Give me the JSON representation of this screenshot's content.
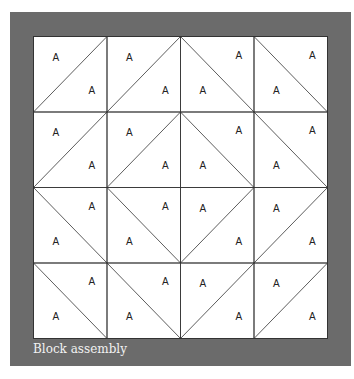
{
  "caption": "Block assembly",
  "colors": {
    "frame": "#6b6b6b",
    "grid_bg": "#ffffff",
    "line": "#333333",
    "caption": "#f2f2f2"
  },
  "grid": {
    "rows": 4,
    "cols": 4,
    "cell_label": "A",
    "diagonals": [
      [
        "/",
        "/",
        "\\",
        "\\"
      ],
      [
        "/",
        "/",
        "\\",
        "\\"
      ],
      [
        "\\",
        "\\",
        "/",
        "/"
      ],
      [
        "\\",
        "\\",
        "/",
        "/"
      ]
    ]
  }
}
